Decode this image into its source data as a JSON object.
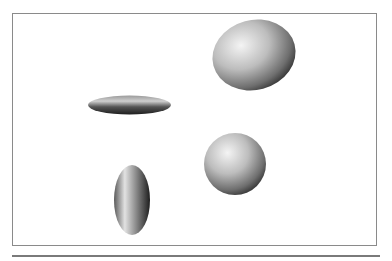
{
  "figure": {
    "frame_color": "#8a8a8a",
    "rule_color": "#7a7a7a",
    "shapes": [
      {
        "name": "tilted-ellipsoid",
        "cx": 254,
        "cy": 55,
        "rx": 42,
        "ry": 35,
        "rotate": -15
      },
      {
        "name": "flat-disc-ellipsoid",
        "cx": 129.5,
        "cy": 105,
        "rx": 41.5,
        "ry": 9.5,
        "rotate": 0
      },
      {
        "name": "sphere",
        "cx": 235,
        "cy": 164,
        "rx": 31,
        "ry": 31,
        "rotate": 0
      },
      {
        "name": "vertical-ellipsoid",
        "cx": 132,
        "cy": 200,
        "rx": 18,
        "ry": 35,
        "rotate": 0
      }
    ]
  }
}
